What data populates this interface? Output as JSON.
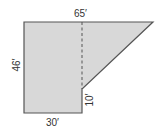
{
  "diagram": {
    "title": "",
    "fill_color": "#d8d8d8",
    "stroke_color": "#555555",
    "shape": {
      "polygon_points": [
        [
          24,
          22
        ],
        [
          153,
          22
        ],
        [
          82,
          89
        ],
        [
          82,
          113
        ],
        [
          24,
          113
        ]
      ],
      "dashed_line": {
        "x": 82,
        "y1": 22,
        "y2": 89
      }
    },
    "labels": {
      "top": "65′",
      "left": "46′",
      "right_segment": "10′",
      "bottom": "30′"
    },
    "dimensions": {
      "top_length_ft": 65,
      "left_height_ft": 46,
      "right_segment_height_ft": 10,
      "bottom_length_ft": 30
    }
  }
}
